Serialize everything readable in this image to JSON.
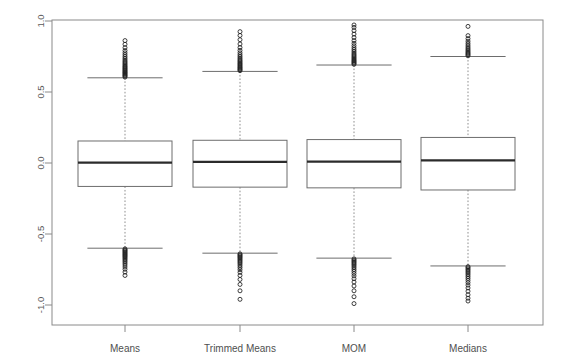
{
  "chart_data": {
    "type": "boxplot",
    "title": "",
    "subtitle": "",
    "xlabel": "",
    "ylabel": "",
    "categories": [
      "Means",
      "Trimmed Means",
      "MOM",
      "Medians"
    ],
    "ylim": [
      -1.05,
      1.05
    ],
    "y_ticks": [
      -1.0,
      -0.5,
      0.0,
      0.5,
      1.0
    ],
    "y_tick_labels": [
      "-1.0",
      "-0.5",
      "0.0",
      "0.5",
      "1.0"
    ],
    "grid": false,
    "legend": "none",
    "box_color": "#ffffff",
    "box_edge_color": "#6d6d6d",
    "median_color": "#2b2b2b",
    "whisker_color": "#8f8f8f",
    "outlier_color": "#1f1f1f",
    "frame_color": "#8a8a8a",
    "boxes": [
      {
        "name": "Means",
        "q1": -0.165,
        "median": 0.003,
        "q3": 0.155,
        "whisker_low": -0.6,
        "whisker_high": 0.6,
        "outliers_high": [
          0.605,
          0.612,
          0.618,
          0.624,
          0.631,
          0.637,
          0.643,
          0.65,
          0.656,
          0.663,
          0.669,
          0.676,
          0.682,
          0.69,
          0.698,
          0.707,
          0.716,
          0.726,
          0.737,
          0.749,
          0.762,
          0.776,
          0.792,
          0.812,
          0.836,
          0.862
        ],
        "outliers_low": [
          -0.605,
          -0.612,
          -0.618,
          -0.625,
          -0.632,
          -0.639,
          -0.646,
          -0.653,
          -0.66,
          -0.668,
          -0.676,
          -0.685,
          -0.695,
          -0.706,
          -0.718,
          -0.732,
          -0.748,
          -0.768,
          -0.792
        ]
      },
      {
        "name": "Trimmed Means",
        "q1": -0.17,
        "median": 0.008,
        "q3": 0.16,
        "whisker_low": -0.635,
        "whisker_high": 0.645,
        "outliers_high": [
          0.65,
          0.657,
          0.663,
          0.67,
          0.676,
          0.683,
          0.69,
          0.697,
          0.704,
          0.712,
          0.72,
          0.729,
          0.739,
          0.75,
          0.762,
          0.776,
          0.793,
          0.813,
          0.838,
          0.868,
          0.898,
          0.925
        ],
        "outliers_low": [
          -0.64,
          -0.647,
          -0.654,
          -0.661,
          -0.668,
          -0.676,
          -0.684,
          -0.693,
          -0.702,
          -0.712,
          -0.724,
          -0.737,
          -0.752,
          -0.77,
          -0.792,
          -0.82,
          -0.855,
          -0.9,
          -0.96
        ]
      },
      {
        "name": "MOM",
        "q1": -0.175,
        "median": 0.01,
        "q3": 0.165,
        "whisker_low": -0.67,
        "whisker_high": 0.69,
        "outliers_high": [
          0.695,
          0.702,
          0.709,
          0.716,
          0.723,
          0.731,
          0.739,
          0.747,
          0.756,
          0.765,
          0.775,
          0.786,
          0.798,
          0.811,
          0.826,
          0.843,
          0.862,
          0.884,
          0.908,
          0.932,
          0.955,
          0.972
        ],
        "outliers_low": [
          -0.675,
          -0.683,
          -0.691,
          -0.699,
          -0.708,
          -0.717,
          -0.727,
          -0.738,
          -0.75,
          -0.763,
          -0.778,
          -0.795,
          -0.815,
          -0.838,
          -0.866,
          -0.9,
          -0.942,
          -0.99
        ]
      },
      {
        "name": "Medians",
        "q1": -0.19,
        "median": 0.018,
        "q3": 0.18,
        "whisker_low": -0.725,
        "whisker_high": 0.75,
        "outliers_high": [
          0.755,
          0.763,
          0.771,
          0.779,
          0.788,
          0.797,
          0.807,
          0.818,
          0.83,
          0.843,
          0.858,
          0.876,
          0.897,
          0.962
        ],
        "outliers_low": [
          -0.73,
          -0.738,
          -0.747,
          -0.756,
          -0.766,
          -0.776,
          -0.787,
          -0.799,
          -0.812,
          -0.826,
          -0.842,
          -0.86,
          -0.88,
          -0.903,
          -0.928,
          -0.952,
          -0.972
        ]
      }
    ]
  },
  "axis": {
    "y_label_1": "1.0",
    "y_label_05": "0.5",
    "y_label_0": "0.0",
    "y_label_neg05": "-0.5",
    "y_label_neg1": "-1.0"
  },
  "groups": {
    "g0": "Means",
    "g1": "Trimmed Means",
    "g2": "MOM",
    "g3": "Medians"
  }
}
